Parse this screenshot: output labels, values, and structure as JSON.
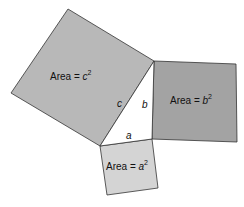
{
  "diagram": {
    "squares": {
      "c": {
        "label_prefix": "Area = ",
        "var": "c",
        "exp": "2",
        "fill": "#b8b8b8"
      },
      "b": {
        "label_prefix": "Area = ",
        "var": "b",
        "exp": "2",
        "fill": "#a3a3a3"
      },
      "a": {
        "label_prefix": "Area = ",
        "var": "a",
        "exp": "2",
        "fill": "#d4d4d4"
      }
    },
    "triangle": {
      "side_a": "a",
      "side_b": "b",
      "side_c": "c"
    },
    "stroke": "#333333"
  }
}
